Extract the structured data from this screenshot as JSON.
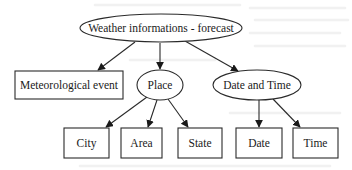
{
  "diagram": {
    "type": "tree",
    "title": "Weather informations - forecast",
    "colors": {
      "stroke": "#2a2a2a",
      "text": "#1a1a1a",
      "background": "#ffffff"
    },
    "nodes": {
      "root": {
        "label": "Weather informations - forecast",
        "shape": "ellipse"
      },
      "meteorological_event": {
        "label": "Meteorological event",
        "shape": "box"
      },
      "place": {
        "label": "Place",
        "shape": "ellipse"
      },
      "date_and_time": {
        "label": "Date and Time",
        "shape": "ellipse"
      },
      "city": {
        "label": "City",
        "shape": "box"
      },
      "area": {
        "label": "Area",
        "shape": "box"
      },
      "state": {
        "label": "State",
        "shape": "box"
      },
      "date": {
        "label": "Date",
        "shape": "box"
      },
      "time": {
        "label": "Time",
        "shape": "box"
      }
    },
    "edges": [
      {
        "from": "Weather informations - forecast",
        "to": "Meteorological event"
      },
      {
        "from": "Weather informations - forecast",
        "to": "Place"
      },
      {
        "from": "Weather informations - forecast",
        "to": "Date and Time"
      },
      {
        "from": "Place",
        "to": "City"
      },
      {
        "from": "Place",
        "to": "Area"
      },
      {
        "from": "Place",
        "to": "State"
      },
      {
        "from": "Date and Time",
        "to": "Date"
      },
      {
        "from": "Date and Time",
        "to": "Time"
      }
    ]
  }
}
